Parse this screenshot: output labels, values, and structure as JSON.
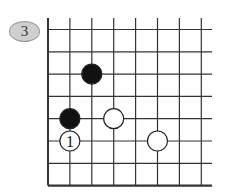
{
  "problem": {
    "number": "3",
    "badge_color": "#cfcfcf"
  },
  "board": {
    "type": "go-diagram",
    "corner": "bottom-left",
    "columns": 8,
    "rows": 8,
    "line_color": "#333333",
    "stones": [
      {
        "color": "black",
        "col": 2,
        "row": 2,
        "label": ""
      },
      {
        "color": "black",
        "col": 1,
        "row": 4,
        "label": ""
      },
      {
        "color": "white",
        "col": 3,
        "row": 4,
        "label": ""
      },
      {
        "color": "white",
        "col": 1,
        "row": 5,
        "label": "1"
      },
      {
        "color": "white",
        "col": 5,
        "row": 5,
        "label": ""
      }
    ]
  }
}
